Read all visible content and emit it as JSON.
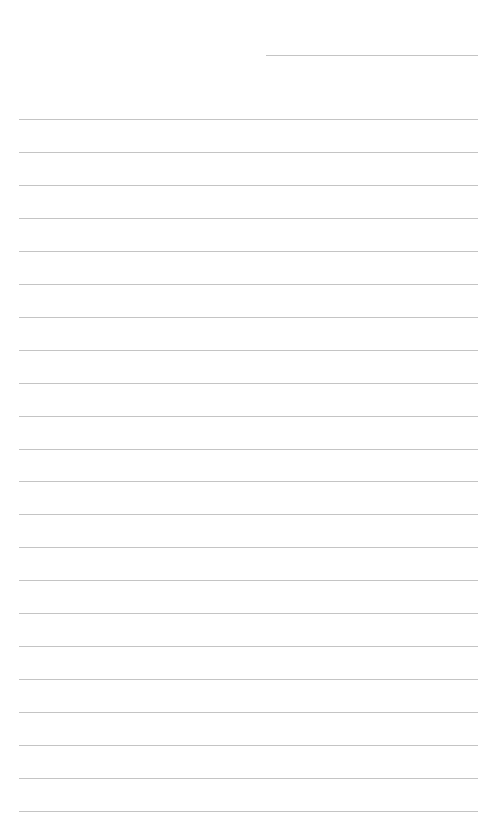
{
  "page": {
    "type": "lined-notebook-page",
    "background": "#ffffff",
    "line_color": "#c4c4c4"
  },
  "header_line": {
    "left": 266,
    "right": 478,
    "y": 55
  },
  "ruled_lines": {
    "count": 22,
    "left": 19,
    "right": 478,
    "first_y": 119,
    "spacing": 32.95
  }
}
